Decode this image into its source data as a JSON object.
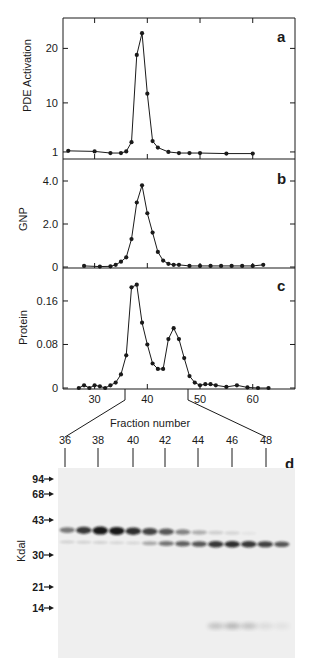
{
  "chart_data": [
    {
      "panel": "a",
      "type": "line",
      "title": "",
      "xlabel": "",
      "ylabel": "PDE Activation",
      "yticks": [
        1,
        10,
        20
      ],
      "ylim": [
        0,
        26
      ],
      "xlim": [
        24,
        68
      ],
      "xticks": [
        30,
        40,
        50,
        60
      ],
      "grid": false,
      "x": [
        25,
        30,
        33,
        35,
        36,
        37,
        38,
        39,
        40,
        41,
        42,
        44,
        46,
        48,
        50,
        55,
        60
      ],
      "values": [
        1.2,
        1.1,
        0.8,
        0.8,
        1.1,
        2.8,
        18.8,
        22.8,
        11.7,
        3.0,
        1.8,
        1.0,
        0.8,
        0.8,
        0.8,
        0.7,
        0.7
      ]
    },
    {
      "panel": "b",
      "type": "line",
      "title": "",
      "xlabel": "",
      "ylabel": "GNP",
      "yticks": [
        "0",
        "2.0",
        "4.0"
      ],
      "ylim": [
        0,
        4.5
      ],
      "xlim": [
        24,
        68
      ],
      "xticks": [
        30,
        40,
        50,
        60
      ],
      "grid": false,
      "x": [
        28,
        31,
        33,
        34,
        35,
        36,
        37,
        38,
        39,
        40,
        41,
        42,
        43,
        44,
        45,
        46,
        48,
        50,
        52,
        54,
        56,
        58,
        60,
        62
      ],
      "values": [
        0.05,
        0.02,
        0.03,
        0.1,
        0.25,
        0.45,
        1.3,
        3.0,
        3.8,
        2.5,
        1.6,
        0.7,
        0.3,
        0.15,
        0.1,
        0.1,
        0.05,
        0.05,
        0.05,
        0.05,
        0.05,
        0.05,
        0.05,
        0.1
      ]
    },
    {
      "panel": "c",
      "type": "line",
      "title": "",
      "xlabel": "Fraction number",
      "ylabel": "Protein",
      "yticks": [
        "0",
        "0.08",
        "0.16"
      ],
      "ylim": [
        0,
        0.21
      ],
      "xlim": [
        24,
        68
      ],
      "xticks": [
        30,
        40,
        50,
        60
      ],
      "grid": false,
      "x": [
        27,
        28,
        29,
        30,
        31,
        32,
        33,
        34,
        35,
        36,
        37,
        38,
        39,
        40,
        41,
        42,
        43,
        44,
        45,
        46,
        47,
        48,
        49,
        50,
        51,
        52,
        53,
        55,
        57,
        59,
        61,
        63
      ],
      "values": [
        0.0,
        0.005,
        0.0,
        0.005,
        0.003,
        0.0,
        0.005,
        0.01,
        0.025,
        0.06,
        0.185,
        0.19,
        0.12,
        0.08,
        0.045,
        0.035,
        0.035,
        0.09,
        0.11,
        0.09,
        0.055,
        0.022,
        0.01,
        0.005,
        0.007,
        0.007,
        0.005,
        0.002,
        0.005,
        0.001,
        0.0,
        0.0
      ]
    },
    {
      "panel": "d",
      "type": "gel",
      "ylabel": "Kdal",
      "markers": [
        "94",
        "68",
        "43",
        "30",
        "21",
        "14"
      ],
      "fraction_labels": [
        "36",
        "38",
        "40",
        "42",
        "44",
        "46",
        "48"
      ],
      "lanes": 14,
      "upper_band_intensity": [
        0.55,
        0.85,
        1.0,
        1.0,
        0.9,
        0.8,
        0.7,
        0.5,
        0.3,
        0.15,
        0.12,
        0.05,
        0,
        0
      ],
      "lower_band_intensity": [
        0.15,
        0.15,
        0.15,
        0.12,
        0.12,
        0.35,
        0.6,
        0.7,
        0.75,
        0.9,
        0.95,
        0.9,
        0.85,
        0.75
      ],
      "low_band_intensity": [
        0,
        0,
        0,
        0,
        0,
        0,
        0,
        0,
        0,
        0.35,
        0.45,
        0.35,
        0.15,
        0.1
      ]
    }
  ],
  "labels": {
    "panel_a": "a",
    "panel_b": "b",
    "panel_c": "c",
    "panel_d": "d",
    "ylabel_a": "PDE Activation",
    "ylabel_b": "GNP",
    "ylabel_c": "Protein",
    "ylabel_d": "Kdal",
    "xlabel": "Fraction number"
  }
}
